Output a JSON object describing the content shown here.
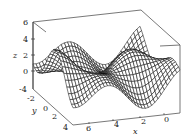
{
  "chart_data": {
    "type": "surface3d",
    "title": "",
    "xlabel": "x",
    "ylabel": "y",
    "zlabel": "z",
    "x_ticks": [
      6,
      4,
      2,
      0
    ],
    "y_ticks": [
      -4,
      -2,
      0,
      2,
      4
    ],
    "z_ticks": [
      0,
      2,
      4,
      6
    ],
    "xlim": [
      0,
      7
    ],
    "ylim": [
      -4,
      4
    ],
    "zlim": [
      -2,
      6
    ],
    "grid": false,
    "legend": null,
    "style": "black wireframe mesh surface inside open box frame"
  },
  "axes": {
    "x": {
      "label": "x",
      "ticks": [
        "6",
        "4",
        "2",
        "0"
      ]
    },
    "y": {
      "label": "y",
      "ticks": [
        "-4",
        "-2",
        "0",
        "2",
        "4"
      ]
    },
    "z": {
      "label": "z",
      "ticks": [
        "6",
        "4",
        "2",
        "0"
      ]
    }
  },
  "colors": {
    "mesh": "#111111",
    "frame": "#555555",
    "background": "#ffffff"
  }
}
